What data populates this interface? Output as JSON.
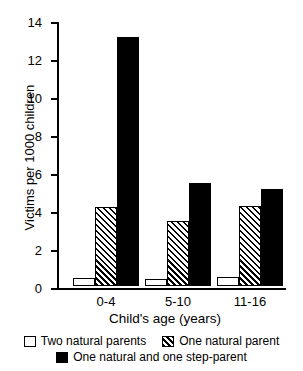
{
  "chart_data": {
    "type": "bar",
    "title": "",
    "subtitle": "",
    "xlabel": "Child's age  (years)",
    "ylabel": "Victims per 1000 children",
    "categories": [
      "0-4",
      "5-10",
      "11-16"
    ],
    "series": [
      {
        "name": "Two natural parents",
        "swatch": "white",
        "values": [
          0.4,
          0.35,
          0.5
        ]
      },
      {
        "name": "One natural parent",
        "swatch": "hatch",
        "values": [
          4.15,
          3.4,
          4.2
        ]
      },
      {
        "name": "One natural and one step-parent",
        "swatch": "black",
        "values": [
          13.1,
          5.4,
          5.1
        ]
      }
    ],
    "ylim": [
      0,
      14
    ],
    "yticks": [
      0,
      2,
      4,
      6,
      8,
      10,
      12,
      14
    ],
    "ytick_labels": [
      "0",
      "2",
      "4",
      "6",
      "8",
      "10",
      "12",
      "14"
    ],
    "grid": false,
    "legend_position": "bottom",
    "colors": {
      "ink": "#000000",
      "background": "#ffffff"
    }
  },
  "legend": {
    "row1": [
      {
        "label": "Two natural parents",
        "swatch": "white"
      },
      {
        "label": "One natural parent",
        "swatch": "hatch"
      }
    ],
    "row2": [
      {
        "label": "One natural and one step-parent",
        "swatch": "black"
      }
    ]
  }
}
